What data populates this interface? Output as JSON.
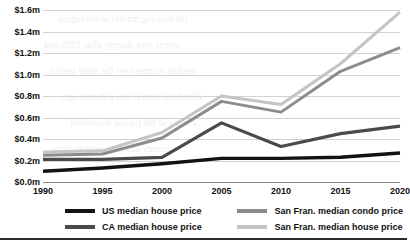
{
  "chart_data": {
    "type": "line",
    "title": "",
    "subtitle": "",
    "xlabel": "",
    "ylabel": "",
    "categories": [
      "1990",
      "1995",
      "2000",
      "2005",
      "2010",
      "2015",
      "2020"
    ],
    "x": [
      1990,
      1995,
      2000,
      2005,
      2010,
      2015,
      2020
    ],
    "xlim": [
      1990,
      2020
    ],
    "ylim": [
      0.0,
      1.6
    ],
    "ytick_values": [
      0.0,
      0.2,
      0.4,
      0.6,
      0.8,
      1.0,
      1.2,
      1.4,
      1.6
    ],
    "ytick_labels": [
      "$0.0m",
      "$0.2m",
      "$0.4m",
      "$0.6m",
      "$0.8m",
      "$1.0m",
      "$1.2m",
      "$1.4m",
      "$1.6m"
    ],
    "xtick_labels": [
      "1990",
      "1995",
      "2000",
      "2005",
      "2010",
      "2015",
      "2020"
    ],
    "grid": "horizontal",
    "legend_position": "bottom",
    "units": "millions of US dollars",
    "series": [
      {
        "name": "US median house price",
        "color": "#121212",
        "values": [
          0.1,
          0.13,
          0.17,
          0.22,
          0.22,
          0.23,
          0.27
        ]
      },
      {
        "name": "CA median house price",
        "color": "#4a4a4a",
        "values": [
          0.21,
          0.21,
          0.23,
          0.55,
          0.33,
          0.45,
          0.52
        ]
      },
      {
        "name": "San Fran. median condo price",
        "color": "#8c8c8c",
        "values": [
          0.25,
          0.26,
          0.41,
          0.75,
          0.65,
          1.03,
          1.25
        ]
      },
      {
        "name": "San Fran. median house price",
        "color": "#c4c4c4",
        "values": [
          0.28,
          0.29,
          0.46,
          0.8,
          0.72,
          1.1,
          1.58
        ]
      }
    ]
  },
  "legend": {
    "items": [
      {
        "label": "US median house price",
        "color": "#121212"
      },
      {
        "label": "San Fran. median condo price",
        "color": "#8c8c8c"
      },
      {
        "label": "CA median house price",
        "color": "#4a4a4a"
      },
      {
        "label": "San Fran. median house price",
        "color": "#c4c4c4"
      }
    ]
  },
  "page": {
    "bleed_through_lines": [
      "the housing market in the region",
      "prices rose sharply after 1995 and",
      "median income over the same period",
      "affordable than it was a decade ago",
      "a share of the typical household",
      "county assessor records show"
    ]
  }
}
